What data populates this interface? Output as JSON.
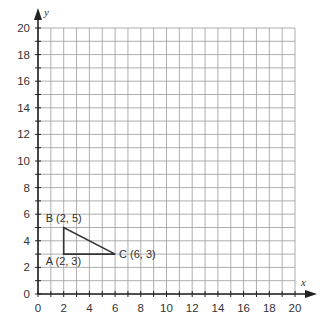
{
  "axes": {
    "x_label": "x",
    "y_label": "y",
    "x_min": 0,
    "x_max": 20,
    "y_min": 0,
    "y_max": 20,
    "x_ticks": [
      "0",
      "2",
      "4",
      "6",
      "8",
      "10",
      "12",
      "14",
      "16",
      "18",
      "20"
    ],
    "y_ticks": [
      "0",
      "2",
      "4",
      "6",
      "8",
      "10",
      "12",
      "14",
      "16",
      "18",
      "20"
    ]
  },
  "grid": {
    "step": 1,
    "color": "#9a9a9a"
  },
  "shape": {
    "type": "triangle",
    "stroke": "#333333",
    "points": [
      {
        "name": "A",
        "x": 2,
        "y": 3,
        "label": "A (2, 3)"
      },
      {
        "name": "B",
        "x": 2,
        "y": 5,
        "label": "B (2, 5)"
      },
      {
        "name": "C",
        "x": 6,
        "y": 3,
        "label": "C (6, 3)"
      }
    ]
  }
}
